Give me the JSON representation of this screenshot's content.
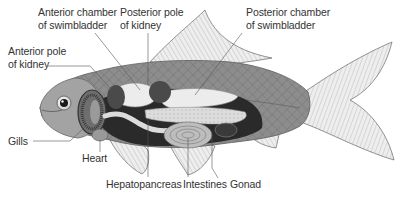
{
  "diagram": {
    "labels": {
      "anterior_chamber": [
        "Anterior chamber",
        "of swimbladder"
      ],
      "posterior_pole": [
        "Posterior pole",
        "of kidney"
      ],
      "posterior_chamber": [
        "Posterior chamber",
        "of swimbladder"
      ],
      "anterior_pole": [
        "Anterior pole",
        "of kidney"
      ],
      "gills": "Gills",
      "heart": "Heart",
      "hepatopancreas": "Hepatopancreas",
      "intestines": "Intestines",
      "gonad": "Gonad"
    },
    "colors": {
      "label_text": "#333333",
      "leader_line": "#555555",
      "body": "#8a8a8a",
      "fin": "#e6e6e6",
      "swimbladder": "#ececec",
      "kidney": "#4a4a4a",
      "hepatopancreas": "#d9d9d9",
      "body_cavity": "#2a2a2a"
    }
  }
}
